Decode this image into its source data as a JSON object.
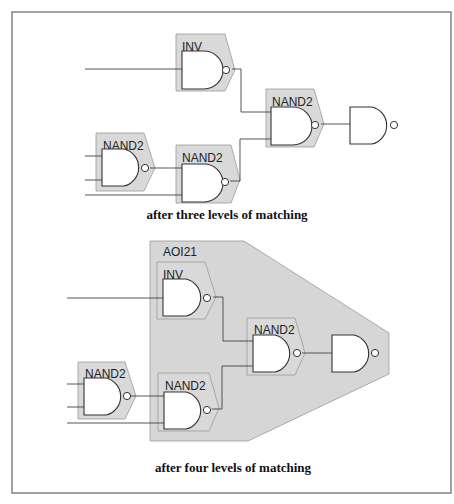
{
  "figure": {
    "panels": [
      {
        "caption": "after three levels of matching",
        "cells": [
          {
            "id": "inv",
            "label": "INV"
          },
          {
            "id": "nand-a",
            "label": "NAND2"
          },
          {
            "id": "nand-b",
            "label": "NAND2"
          },
          {
            "id": "nand-c",
            "label": "NAND2"
          }
        ]
      },
      {
        "caption": "after four levels of matching",
        "group_label": "AOI21",
        "cells": [
          {
            "id": "inv",
            "label": "INV"
          },
          {
            "id": "nand-a",
            "label": "NAND2"
          },
          {
            "id": "nand-b",
            "label": "NAND2"
          },
          {
            "id": "nand-c",
            "label": "NAND2"
          }
        ]
      }
    ]
  },
  "colors": {
    "cell_fill": "#d9d9d9",
    "group_fill": "#d6d6d6",
    "line": "#333333"
  }
}
